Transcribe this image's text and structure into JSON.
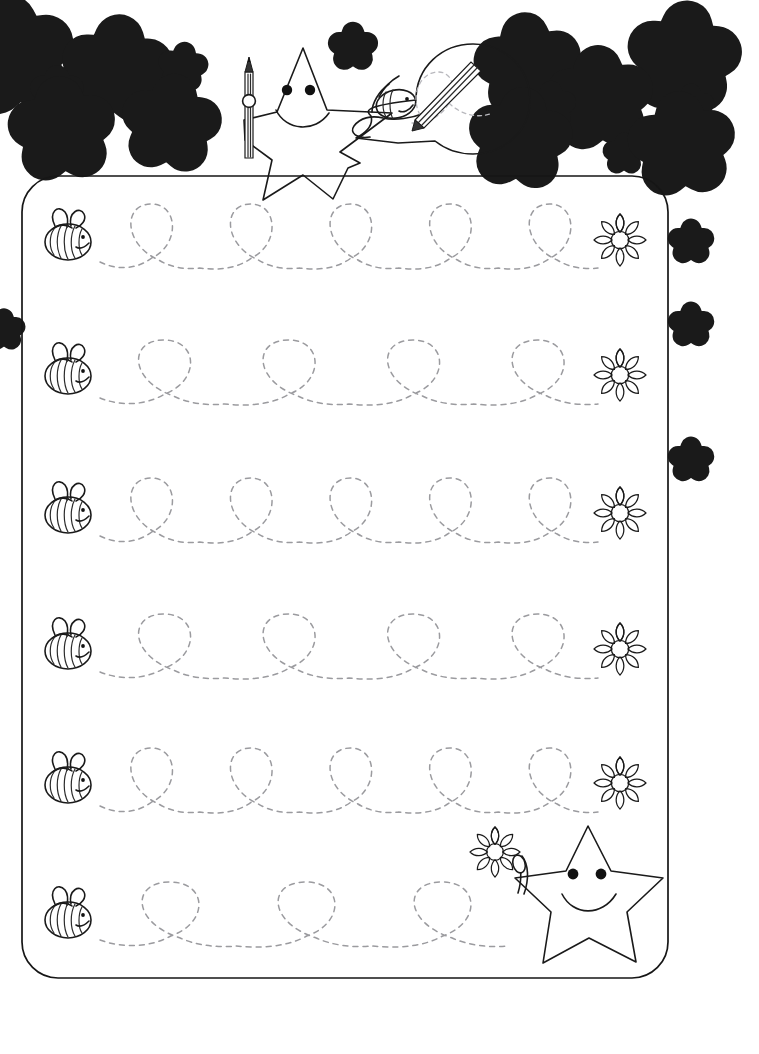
{
  "page": {
    "width": 759,
    "height": 1054,
    "background_color": "#ffffff",
    "ink_color": "#1a1a1a",
    "trace_color": "#9b9b9f"
  },
  "header": {
    "name": "decorative-header",
    "mascot": {
      "name": "smiling-star-with-pencil",
      "face": "smile",
      "eyes": 2,
      "holds": "pencil"
    },
    "speech_bubble": {
      "name": "bee-drawing-bubble",
      "contains": "bee-holding-pencil-drawing-loop",
      "shows_dashed_loop": true
    },
    "stars": [
      {
        "cx": 14,
        "cy": 56,
        "r": 34,
        "rot": -8
      },
      {
        "cx": 117,
        "cy": 70,
        "r": 31,
        "rot": 4
      },
      {
        "cx": 57,
        "cy": 92,
        "r": 15,
        "rot": 0
      },
      {
        "cx": 183,
        "cy": 67,
        "r": 14,
        "rot": 6
      },
      {
        "cx": 62,
        "cy": 130,
        "r": 30,
        "rot": -5
      },
      {
        "cx": 171,
        "cy": 124,
        "r": 28,
        "rot": 7
      },
      {
        "cx": 353,
        "cy": 47,
        "r": 14,
        "rot": 0
      },
      {
        "cx": 528,
        "cy": 66,
        "r": 30,
        "rot": -6
      },
      {
        "cx": 657,
        "cy": 63,
        "r": 12,
        "rot": 0
      },
      {
        "cx": 684,
        "cy": 58,
        "r": 32,
        "rot": 5
      },
      {
        "cx": 600,
        "cy": 99,
        "r": 30,
        "rot": -4
      },
      {
        "cx": 551,
        "cy": 106,
        "r": 14,
        "rot": 0
      },
      {
        "cx": 691,
        "cy": 107,
        "r": 13,
        "rot": 0
      },
      {
        "cx": 520,
        "cy": 139,
        "r": 29,
        "rot": 6
      },
      {
        "cx": 624,
        "cy": 154,
        "r": 12,
        "rot": 0
      },
      {
        "cx": 682,
        "cy": 145,
        "r": 30,
        "rot": -5
      }
    ],
    "side_stars": [
      {
        "cx": 691,
        "cy": 242,
        "r": 13,
        "rot": 0
      },
      {
        "cx": 691,
        "cy": 325,
        "r": 13,
        "rot": 0
      },
      {
        "cx": 691,
        "cy": 460,
        "r": 13,
        "rot": 0
      },
      {
        "cx": 4,
        "cy": 330,
        "r": 12,
        "rot": 0
      }
    ]
  },
  "worksheet": {
    "name": "tracing-panel",
    "frame": {
      "x": 22,
      "y": 176,
      "width": 646,
      "height": 802,
      "radius": 36
    },
    "task": "trace-the-loops-from-bee-to-flower",
    "rows": [
      {
        "index": 1,
        "start_icon": "bee",
        "end_icon": "flower",
        "loops": 5,
        "baseline_y": 262,
        "loop_height": 58,
        "start_x": 100,
        "end_x": 598,
        "bee": {
          "cx": 68,
          "cy": 238
        },
        "flower": {
          "cx": 620,
          "cy": 240,
          "r": 26
        }
      },
      {
        "index": 2,
        "start_icon": "bee",
        "end_icon": "flower",
        "loops": 4,
        "baseline_y": 398,
        "loop_height": 58,
        "start_x": 100,
        "end_x": 598,
        "bee": {
          "cx": 68,
          "cy": 372
        },
        "flower": {
          "cx": 620,
          "cy": 375,
          "r": 26
        }
      },
      {
        "index": 3,
        "start_icon": "bee",
        "end_icon": "flower",
        "loops": 5,
        "baseline_y": 536,
        "loop_height": 58,
        "start_x": 100,
        "end_x": 598,
        "bee": {
          "cx": 68,
          "cy": 511
        },
        "flower": {
          "cx": 620,
          "cy": 513,
          "r": 26
        }
      },
      {
        "index": 4,
        "start_icon": "bee",
        "end_icon": "flower",
        "loops": 4,
        "baseline_y": 672,
        "loop_height": 58,
        "start_x": 100,
        "end_x": 598,
        "bee": {
          "cx": 68,
          "cy": 647
        },
        "flower": {
          "cx": 620,
          "cy": 649,
          "r": 26
        }
      },
      {
        "index": 5,
        "start_icon": "bee",
        "end_icon": "flower",
        "loops": 5,
        "baseline_y": 806,
        "loop_height": 58,
        "start_x": 100,
        "end_x": 598,
        "bee": {
          "cx": 68,
          "cy": 781
        },
        "flower": {
          "cx": 620,
          "cy": 783,
          "r": 26
        }
      },
      {
        "index": 6,
        "start_icon": "bee",
        "end_icon": "flower-with-star",
        "loops": 3,
        "baseline_y": 940,
        "loop_height": 58,
        "start_x": 100,
        "end_x": 508,
        "bee": {
          "cx": 68,
          "cy": 916
        },
        "flower": {
          "cx": 495,
          "cy": 852,
          "r": 25
        },
        "star": {
          "cx": 590,
          "cy": 885,
          "r": 62
        }
      }
    ]
  },
  "icons": {
    "bee": "bee-icon",
    "flower": "flower-icon",
    "star": "star-icon",
    "pencil": "pencil-icon",
    "speech_bubble": "speech-bubble-icon"
  }
}
